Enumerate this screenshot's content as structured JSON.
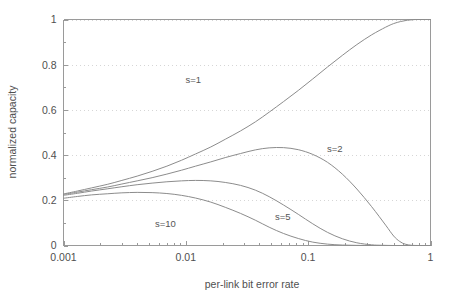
{
  "chart_data": {
    "type": "line",
    "title": "",
    "subtitle": "",
    "xlabel": "per-link bit error rate",
    "ylabel": "normalized capacity",
    "xscale": "log",
    "yscale": "linear",
    "xlim": [
      0.001,
      1
    ],
    "ylim": [
      0,
      1
    ],
    "grid": true,
    "legend_position": "inline-annotations",
    "xticks": [
      0.001,
      0.01,
      0.1,
      1
    ],
    "xtick_labels": [
      "0.001",
      "0.01",
      "0.1",
      "1"
    ],
    "yticks": [
      0,
      0.2,
      0.4,
      0.6,
      0.8,
      1
    ],
    "ytick_labels": [
      "0",
      "0.2",
      "0.4",
      "0.6",
      "0.8",
      "1"
    ],
    "yminor_ticks": [
      0.1,
      0.3,
      0.5,
      0.7,
      0.9
    ],
    "series": [
      {
        "name": "s=1",
        "label": "s=1",
        "label_x": 0.0115,
        "label_y": 0.72,
        "x": [
          0.001,
          0.0013,
          0.0017,
          0.0023,
          0.003,
          0.004,
          0.0053,
          0.007,
          0.0092,
          0.012,
          0.016,
          0.021,
          0.028,
          0.037,
          0.048,
          0.063,
          0.083,
          0.109,
          0.144,
          0.19,
          0.25,
          0.33,
          0.43,
          0.5,
          0.57,
          0.65,
          0.75,
          0.87,
          1.0
        ],
        "y": [
          0.228,
          0.241,
          0.255,
          0.271,
          0.288,
          0.307,
          0.328,
          0.351,
          0.377,
          0.405,
          0.436,
          0.47,
          0.507,
          0.547,
          0.59,
          0.637,
          0.686,
          0.737,
          0.79,
          0.841,
          0.889,
          0.932,
          0.966,
          0.982,
          0.991,
          0.997,
          1.0,
          1.0,
          1.0
        ]
      },
      {
        "name": "s=2",
        "label": "s=2",
        "label_x": 0.165,
        "label_y": 0.415,
        "x": [
          0.001,
          0.0013,
          0.0017,
          0.0023,
          0.003,
          0.004,
          0.0053,
          0.007,
          0.0092,
          0.012,
          0.016,
          0.021,
          0.028,
          0.037,
          0.048,
          0.063,
          0.083,
          0.109,
          0.144,
          0.19,
          0.25,
          0.33,
          0.43,
          0.5,
          0.56,
          0.62,
          0.7,
          0.8,
          1.0
        ],
        "y": [
          0.226,
          0.236,
          0.247,
          0.259,
          0.272,
          0.286,
          0.3,
          0.316,
          0.333,
          0.351,
          0.37,
          0.389,
          0.407,
          0.423,
          0.432,
          0.433,
          0.424,
          0.403,
          0.368,
          0.316,
          0.25,
          0.172,
          0.09,
          0.042,
          0.018,
          0.006,
          0.001,
          0.0,
          0.0
        ]
      },
      {
        "name": "s=5",
        "label": "s=5",
        "label_x": 0.062,
        "label_y": 0.112,
        "x": [
          0.001,
          0.0013,
          0.0017,
          0.0023,
          0.003,
          0.004,
          0.0053,
          0.007,
          0.0092,
          0.012,
          0.016,
          0.021,
          0.028,
          0.037,
          0.048,
          0.063,
          0.083,
          0.109,
          0.144,
          0.19,
          0.25,
          0.33,
          0.4,
          0.5,
          0.65,
          0.8,
          1.0
        ],
        "y": [
          0.222,
          0.231,
          0.241,
          0.251,
          0.26,
          0.269,
          0.276,
          0.282,
          0.286,
          0.288,
          0.286,
          0.279,
          0.266,
          0.245,
          0.216,
          0.179,
          0.138,
          0.096,
          0.058,
          0.03,
          0.012,
          0.003,
          0.001,
          0.0,
          0.0,
          0.0,
          0.0
        ]
      },
      {
        "name": "s=10",
        "label": "s=10",
        "label_x": 0.0068,
        "label_y": 0.082,
        "x": [
          0.001,
          0.0013,
          0.0017,
          0.0023,
          0.003,
          0.004,
          0.0053,
          0.007,
          0.0092,
          0.012,
          0.016,
          0.021,
          0.028,
          0.037,
          0.048,
          0.063,
          0.083,
          0.109,
          0.144,
          0.19,
          0.25,
          0.33,
          0.42,
          0.55,
          0.7,
          1.0
        ],
        "y": [
          0.209,
          0.217,
          0.224,
          0.229,
          0.233,
          0.235,
          0.234,
          0.23,
          0.222,
          0.21,
          0.192,
          0.169,
          0.142,
          0.112,
          0.081,
          0.053,
          0.031,
          0.015,
          0.006,
          0.002,
          0.0005,
          0.0,
          0.0,
          0.0,
          0.0,
          0.0
        ]
      }
    ]
  },
  "colors": {
    "curve": "#8c8c8c",
    "axis": "#9a9a9a",
    "grid": "#d6d6d6",
    "text": "#4f4f4f",
    "background": "#ffffff"
  }
}
